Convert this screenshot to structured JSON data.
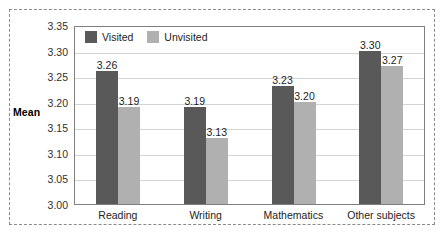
{
  "chart_data": {
    "type": "bar",
    "title": "",
    "xlabel": "",
    "ylabel": "Mean",
    "ylim": [
      3.0,
      3.35
    ],
    "ytick_step": 0.05,
    "grid": true,
    "legend_position": "top-left-inside",
    "categories": [
      "Reading",
      "Writing",
      "Mathematics",
      "Other subjects"
    ],
    "series": [
      {
        "name": "Visited",
        "color": "#595959",
        "values": [
          3.26,
          3.19,
          3.23,
          3.3
        ],
        "value_labels": [
          "3.26",
          "3.19",
          "3.23",
          "3.30"
        ]
      },
      {
        "name": "Unvisited",
        "color": "#b0b0b0",
        "values": [
          3.19,
          3.13,
          3.2,
          3.27
        ],
        "value_labels": [
          "3.19",
          "3.13",
          "3.20",
          "3.27"
        ]
      }
    ],
    "ytick_labels": [
      "3.35",
      "3.30",
      "3.25",
      "3.20",
      "3.15",
      "3.10",
      "3.05",
      "3.00"
    ],
    "ytick_values": [
      3.35,
      3.3,
      3.25,
      3.2,
      3.15,
      3.1,
      3.05,
      3.0
    ]
  },
  "legend": {
    "items": [
      {
        "label": "Visited",
        "color": "#595959"
      },
      {
        "label": "Unvisited",
        "color": "#b0b0b0"
      }
    ]
  },
  "axis": {
    "y_title": "Mean"
  },
  "style": {
    "frame_color": "#8a8a8a",
    "plot_border_color": "#7f7f7f",
    "gridline_color": "#d4d4d4",
    "text_color": "#232323",
    "background": "#ffffff"
  }
}
